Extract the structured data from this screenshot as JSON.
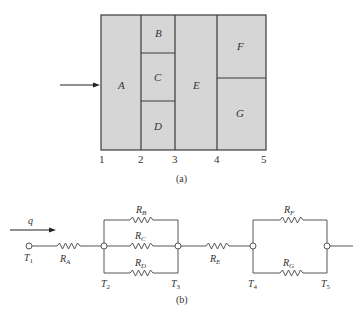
{
  "figure_a": {
    "regions": [
      {
        "id": "A",
        "label": "A"
      },
      {
        "id": "B",
        "label": "B"
      },
      {
        "id": "C",
        "label": "C"
      },
      {
        "id": "D",
        "label": "D"
      },
      {
        "id": "E",
        "label": "E"
      },
      {
        "id": "F",
        "label": "F"
      },
      {
        "id": "G",
        "label": "G"
      }
    ],
    "axis_ticks": [
      "1",
      "2",
      "3",
      "4",
      "5"
    ],
    "caption": "(a)",
    "fill_color": "#d6d6d6",
    "line_color": "#3a3a3a"
  },
  "figure_b": {
    "flow_label": "q",
    "nodes": [
      {
        "id": "T1",
        "main": "T",
        "sub": "1"
      },
      {
        "id": "T2",
        "main": "T",
        "sub": "2"
      },
      {
        "id": "T3",
        "main": "T",
        "sub": "3"
      },
      {
        "id": "T4",
        "main": "T",
        "sub": "4"
      },
      {
        "id": "T5",
        "main": "T",
        "sub": "5"
      }
    ],
    "resistors": [
      {
        "id": "RA",
        "main": "R",
        "sub": "A"
      },
      {
        "id": "RB",
        "main": "R",
        "sub": "B"
      },
      {
        "id": "RC",
        "main": "R",
        "sub": "C"
      },
      {
        "id": "RD",
        "main": "R",
        "sub": "D"
      },
      {
        "id": "RE",
        "main": "R",
        "sub": "E"
      },
      {
        "id": "RF",
        "main": "R",
        "sub": "F"
      },
      {
        "id": "RG",
        "main": "R",
        "sub": "G"
      }
    ],
    "caption": "(b)"
  }
}
